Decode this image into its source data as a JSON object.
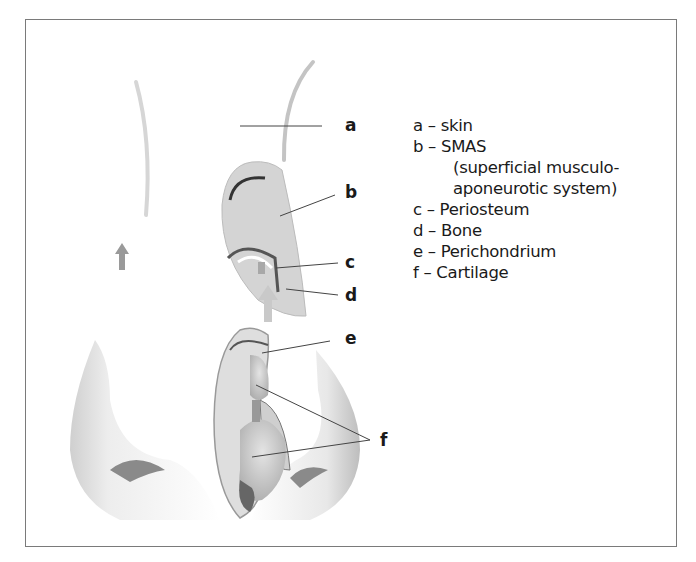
{
  "figure": {
    "type": "anatomical-diagram"
  },
  "labels": {
    "a": "a",
    "b": "b",
    "c": "c",
    "d": "d",
    "e": "e",
    "f": "f"
  },
  "legend": {
    "items": [
      {
        "key": "a",
        "text": "a – skin"
      },
      {
        "key": "b",
        "text": "b – SMAS"
      },
      {
        "key": "b_cont1",
        "text": "(superficial musculo-"
      },
      {
        "key": "b_cont2",
        "text": "aponeurotic system)"
      },
      {
        "key": "c",
        "text": "c – Periosteum"
      },
      {
        "key": "d",
        "text": "d – Bone"
      },
      {
        "key": "e",
        "text": "e – Perichondrium"
      },
      {
        "key": "f",
        "text": "f – Cartilage"
      }
    ]
  },
  "colors": {
    "frame": "#7a7a7a",
    "text": "#1a1a1a",
    "tissue": "#c8c8c8",
    "arrow": "#9a9a9a",
    "leader": "#444444"
  }
}
